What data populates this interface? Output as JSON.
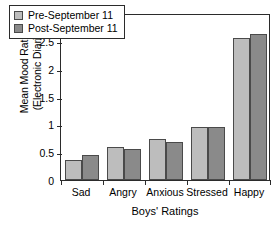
{
  "chart_data": {
    "type": "bar",
    "title": "",
    "xlabel": "Boys' Ratings",
    "ylabel_line1": "Mean Mood Ratings",
    "ylabel_line2": "(Electronic Diaries)",
    "categories": [
      "Sad",
      "Angry",
      "Anxious",
      "Stressed",
      "Happy"
    ],
    "series": [
      {
        "name": "Pre-September 11",
        "color": "#bdbdbd",
        "values": [
          0.36,
          0.59,
          0.74,
          0.95,
          2.55
        ]
      },
      {
        "name": "Post-September 11",
        "color": "#8a8a8a",
        "values": [
          0.45,
          0.56,
          0.69,
          0.96,
          2.63
        ]
      }
    ],
    "ylim": [
      0,
      3
    ],
    "yticks": [
      0,
      0.5,
      1,
      1.5,
      2,
      2.5,
      3
    ],
    "ytick_labels": [
      "0",
      "0.5",
      "1",
      "1.5",
      "2",
      "2.5",
      "3"
    ],
    "grid": false,
    "legend_position": "upper-left-inside",
    "axis_color": "#2b2b2b",
    "bar_edge_color": "#4a4a4a"
  }
}
